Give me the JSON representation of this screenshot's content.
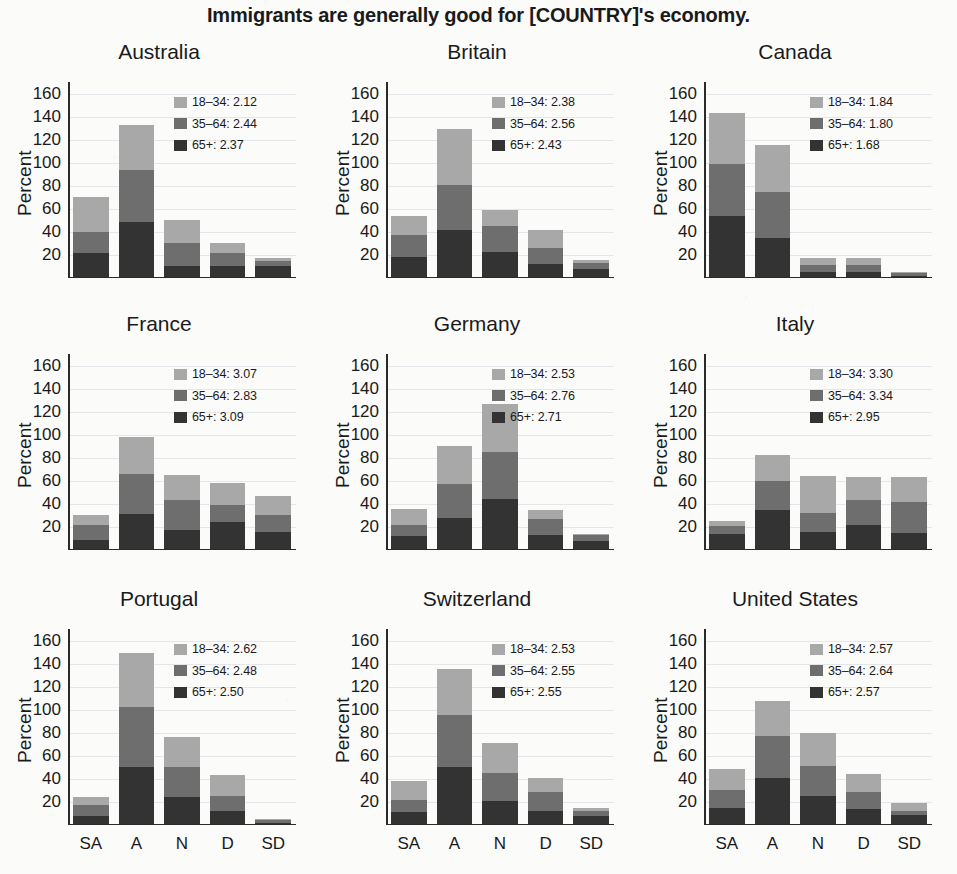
{
  "chart_data": {
    "type": "bar",
    "title": "Immigrants are generally good for [COUNTRY]'s economy.",
    "xlabel": "",
    "ylabel": "Percent",
    "categories": [
      "SA",
      "A",
      "N",
      "D",
      "SD"
    ],
    "ylim": [
      0,
      170
    ],
    "yticks": [
      20,
      40,
      60,
      80,
      100,
      120,
      140,
      160
    ],
    "grid": true,
    "stacked": true,
    "legend_position": "inside-top-right",
    "series_names": [
      "18–34",
      "35–64",
      "65+"
    ],
    "colors": {
      "18-34": "#a8a8a8",
      "35-64": "#6e6e6e",
      "65+": "#333333",
      "axis": "#2a2a2a",
      "grid": "#c3c8d2",
      "background": "#fbfbfa"
    },
    "panels": [
      {
        "name": "Australia",
        "legend": [
          {
            "series": "18–34",
            "label": "18–34: 2.12",
            "value": 2.12
          },
          {
            "series": "35–64",
            "label": "35–64: 2.44",
            "value": 2.44
          },
          {
            "series": "65+",
            "label": "65+:  2.37",
            "value": 2.37
          }
        ],
        "series": [
          {
            "name": "65+",
            "values": [
              22,
              49,
              10,
              10,
              10
            ]
          },
          {
            "name": "35–64",
            "values": [
              18,
              45,
              20,
              12,
              5
            ]
          },
          {
            "name": "18–34",
            "values": [
              30,
              39,
              20,
              8,
              2
            ]
          }
        ],
        "totals": [
          70,
          133,
          50,
          30,
          17
        ]
      },
      {
        "name": "Britain",
        "legend": [
          {
            "series": "18–34",
            "label": "18–34: 2.38",
            "value": 2.38
          },
          {
            "series": "35–64",
            "label": "35–64: 2.56",
            "value": 2.56
          },
          {
            "series": "65+",
            "label": "65+:  2.43",
            "value": 2.43
          }
        ],
        "series": [
          {
            "name": "65+",
            "values": [
              18,
              42,
              23,
              12,
              8
            ]
          },
          {
            "name": "35–64",
            "values": [
              19,
              39,
              22,
              14,
              5
            ]
          },
          {
            "name": "18–34",
            "values": [
              17,
              48,
              14,
              16,
              3
            ]
          }
        ],
        "totals": [
          54,
          129,
          59,
          42,
          16
        ]
      },
      {
        "name": "Canada",
        "legend": [
          {
            "series": "18–34",
            "label": "18–34: 1.84",
            "value": 1.84
          },
          {
            "series": "35–64",
            "label": "35–64: 1.80",
            "value": 1.8
          },
          {
            "series": "65+",
            "label": "65+:  1.68",
            "value": 1.68
          }
        ],
        "series": [
          {
            "name": "65+",
            "values": [
              54,
              35,
              5,
              5,
              2
            ]
          },
          {
            "name": "35–64",
            "values": [
              45,
              40,
              6,
              6,
              2
            ]
          },
          {
            "name": "18–34",
            "values": [
              44,
              40,
              6,
              6,
              1
            ]
          }
        ],
        "totals": [
          143,
          115,
          17,
          17,
          5
        ]
      },
      {
        "name": "France",
        "legend": [
          {
            "series": "18–34",
            "label": "18–34: 3.07",
            "value": 3.07
          },
          {
            "series": "35–64",
            "label": "35–64: 2.83",
            "value": 2.83
          },
          {
            "series": "65+",
            "label": "65+:  3.09",
            "value": 3.09
          }
        ],
        "series": [
          {
            "name": "65+",
            "values": [
              9,
              31,
              17,
              24,
              16
            ]
          },
          {
            "name": "35–64",
            "values": [
              13,
              35,
              26,
              15,
              14
            ]
          },
          {
            "name": "18–34",
            "values": [
              8,
              32,
              22,
              19,
              17
            ]
          }
        ],
        "totals": [
          30,
          98,
          65,
          58,
          47
        ]
      },
      {
        "name": "Germany",
        "legend": [
          {
            "series": "18–34",
            "label": "18–34: 2.53",
            "value": 2.53
          },
          {
            "series": "35–64",
            "label": "35–64: 2.76",
            "value": 2.76
          },
          {
            "series": "65+",
            "label": "65+:  2.71",
            "value": 2.71
          }
        ],
        "series": [
          {
            "name": "65+",
            "values": [
              12,
              28,
              44,
              13,
              8
            ]
          },
          {
            "name": "35–64",
            "values": [
              10,
              29,
              41,
              14,
              5
            ]
          },
          {
            "name": "18–34",
            "values": [
              14,
              33,
              42,
              8,
              1
            ]
          }
        ],
        "totals": [
          36,
          90,
          127,
          35,
          14
        ]
      },
      {
        "name": "Italy",
        "legend": [
          {
            "series": "18–34",
            "label": "18–34: 3.30",
            "value": 3.3
          },
          {
            "series": "35–64",
            "label": "35–64: 3.34",
            "value": 3.34
          },
          {
            "series": "65+",
            "label": "65+:  2.95",
            "value": 2.95
          }
        ],
        "series": [
          {
            "name": "65+",
            "values": [
              14,
              35,
              16,
              22,
              15
            ]
          },
          {
            "name": "35–64",
            "values": [
              7,
              25,
              16,
              21,
              27
            ]
          },
          {
            "name": "18–34",
            "values": [
              4,
              22,
              32,
              20,
              21
            ]
          }
        ],
        "totals": [
          25,
          82,
          64,
          63,
          63
        ]
      },
      {
        "name": "Portugal",
        "legend": [
          {
            "series": "18–34",
            "label": "18–34: 2.62",
            "value": 2.62
          },
          {
            "series": "35–64",
            "label": "35–64: 2.48",
            "value": 2.48
          },
          {
            "series": "65+",
            "label": "65+:  2.50",
            "value": 2.5
          }
        ],
        "series": [
          {
            "name": "65+",
            "values": [
              8,
              50,
              24,
              12,
              2
            ]
          },
          {
            "name": "35–64",
            "values": [
              9,
              52,
              26,
              13,
              2
            ]
          },
          {
            "name": "18–34",
            "values": [
              7,
              47,
              26,
              18,
              1
            ]
          }
        ],
        "totals": [
          24,
          149,
          76,
          43,
          5
        ]
      },
      {
        "name": "Switzerland",
        "legend": [
          {
            "series": "18–34",
            "label": "18–34: 2.53",
            "value": 2.53
          },
          {
            "series": "35–64",
            "label": "35–64: 2.55",
            "value": 2.55
          },
          {
            "series": "65+",
            "label": "65+:  2.55",
            "value": 2.55
          }
        ],
        "series": [
          {
            "name": "65+",
            "values": [
              11,
              50,
              21,
              12,
              8
            ]
          },
          {
            "name": "35–64",
            "values": [
              11,
              45,
              24,
              17,
              4
            ]
          },
          {
            "name": "18–34",
            "values": [
              16,
              40,
              26,
              12,
              3
            ]
          }
        ],
        "totals": [
          38,
          135,
          71,
          41,
          15
        ]
      },
      {
        "name": "United States",
        "legend": [
          {
            "series": "18–34",
            "label": "18–34: 2.57",
            "value": 2.57
          },
          {
            "series": "35–64",
            "label": "35–64: 2.64",
            "value": 2.64
          },
          {
            "series": "65+",
            "label": "65+:  2.57",
            "value": 2.57
          }
        ],
        "series": [
          {
            "name": "65+",
            "values": [
              15,
              41,
              25,
              14,
              9
            ]
          },
          {
            "name": "35–64",
            "values": [
              15,
              36,
              26,
              15,
              3
            ]
          },
          {
            "name": "18–34",
            "values": [
              19,
              31,
              29,
              15,
              7
            ]
          }
        ],
        "totals": [
          49,
          108,
          80,
          44,
          19
        ]
      }
    ]
  }
}
